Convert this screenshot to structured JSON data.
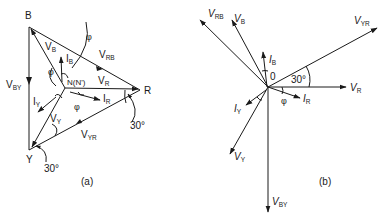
{
  "figure_a": {
    "caption": "(a)",
    "vertices": {
      "B": "B",
      "R": "R",
      "Y": "Y",
      "N": "N(N')"
    },
    "labels": {
      "V_RB": {
        "main": "V",
        "sub": "RB"
      },
      "V_BY": {
        "main": "V",
        "sub": "BY"
      },
      "V_YR": {
        "main": "V",
        "sub": "YR"
      },
      "V_B": {
        "main": "V",
        "sub": "B"
      },
      "V_R": {
        "main": "V",
        "sub": "R"
      },
      "V_Y": {
        "main": "V",
        "sub": "Y"
      },
      "I_B": {
        "main": "I",
        "sub": "B"
      },
      "I_R": {
        "main": "I",
        "sub": "R"
      },
      "I_Y": {
        "main": "I",
        "sub": "Y"
      }
    },
    "phi": "φ",
    "angle_R": "30°",
    "angle_Y": "30°"
  },
  "figure_b": {
    "caption": "(b)",
    "origin": "0",
    "labels": {
      "V_RB": {
        "main": "V",
        "sub": "RB"
      },
      "V_B": {
        "main": "V",
        "sub": "B"
      },
      "V_YR": {
        "main": "V",
        "sub": "YR"
      },
      "V_R": {
        "main": "V",
        "sub": "R"
      },
      "V_Y": {
        "main": "V",
        "sub": "Y"
      },
      "V_BY": {
        "main": "V",
        "sub": "BY"
      },
      "I_B": {
        "main": "I",
        "sub": "B"
      },
      "I_R": {
        "main": "I",
        "sub": "R"
      },
      "I_Y": {
        "main": "I",
        "sub": "Y"
      }
    },
    "phi": "φ",
    "angle": "30°"
  },
  "colors": {
    "ink": "#1a1a1a",
    "background": "#ffffff"
  }
}
